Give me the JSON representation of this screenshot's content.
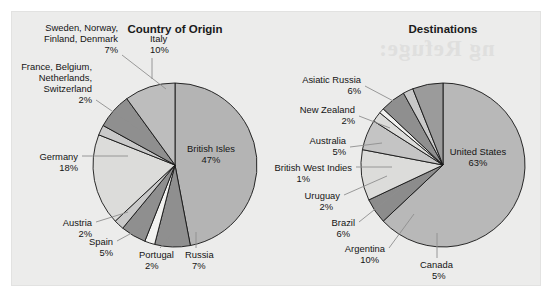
{
  "figure": {
    "background_color": "#ffffff",
    "panel_color": "#ececeb"
  },
  "bleed_text": {
    "line1": "ng Refuge:"
  },
  "charts": [
    {
      "title": "Country of Origin",
      "center": {
        "x": 175,
        "y": 165
      },
      "radius": 82
    },
    {
      "title": "Destinations",
      "center": {
        "x": 443,
        "y": 165
      },
      "radius": 82
    }
  ],
  "chart_data": [
    {
      "type": "pie",
      "title": "Country of Origin",
      "labels": [
        "British Isles",
        "Russia",
        "Portugal",
        "Spain",
        "Austria",
        "Germany",
        "France, Belgium, Netherlands, Switzerland",
        "Sweden, Norway, Finland, Denmark",
        "Italy"
      ],
      "values": [
        47,
        7,
        2,
        5,
        2,
        18,
        2,
        7,
        10
      ],
      "value_labels": [
        "47%",
        "7%",
        "2%",
        "5%",
        "2%",
        "18%",
        "2%",
        "7%",
        "10%"
      ],
      "colors": [
        "#b4b4b4",
        "#8f8f8f",
        "#f2f2f0",
        "#8f8f8f",
        "#c9c9c9",
        "#dcdcda",
        "#c9c9c9",
        "#8f8f8f",
        "#bdbdbd"
      ],
      "start_angle_deg": 0,
      "direction": "clockwise",
      "legend": "none",
      "label_placement": "callout"
    },
    {
      "type": "pie",
      "title": "Destinations",
      "labels": [
        "United States",
        "Canada",
        "Argentina",
        "Brazil",
        "Uruguay",
        "British West Indies",
        "Australia",
        "New Zealand",
        "Asiatic Russia"
      ],
      "values": [
        63,
        5,
        10,
        6,
        2,
        1,
        5,
        2,
        6
      ],
      "value_labels": [
        "63%",
        "5%",
        "10%",
        "6%",
        "2%",
        "1%",
        "5%",
        "2%",
        "6%"
      ],
      "colors": [
        "#b8b8b8",
        "#8c8c8c",
        "#dcdcda",
        "#c4c4c4",
        "#dcdcda",
        "#f2f2f0",
        "#8f8f8f",
        "#c9c9c9",
        "#9b9b9b"
      ],
      "start_angle_deg": 0,
      "direction": "clockwise",
      "legend": "none",
      "label_placement": "callout"
    }
  ],
  "labels_left": [
    {
      "name": "italy",
      "line1": "Italy",
      "line2": "10%",
      "x": 150,
      "y": 48,
      "anchor": "start"
    },
    {
      "name": "sweden-group",
      "line1": "Sweden, Norway,",
      "line2": "Finland, Denmark",
      "line3": "7%",
      "x": 118,
      "y": 48,
      "anchor": "end"
    },
    {
      "name": "france-group",
      "line1": "France, Belgium,",
      "line2": "Netherlands,",
      "line3": "Switzerland",
      "line4": "2%",
      "x": 92,
      "y": 90,
      "anchor": "end"
    },
    {
      "name": "germany",
      "line1": "Germany",
      "line2": "18%",
      "x": 78,
      "y": 160,
      "anchor": "end"
    },
    {
      "name": "austria",
      "line1": "Austria",
      "line2": "2%",
      "x": 92,
      "y": 226,
      "anchor": "end"
    },
    {
      "name": "spain",
      "line1": "Spain",
      "line2": "5%",
      "x": 113,
      "y": 245,
      "anchor": "end"
    },
    {
      "name": "portugal",
      "line1": "Portugal",
      "line2": "2%",
      "x": 139,
      "y": 258,
      "anchor": "start"
    },
    {
      "name": "russia",
      "line1": "Russia",
      "line2": "7%",
      "x": 185,
      "y": 258,
      "anchor": "start"
    },
    {
      "name": "british-isles",
      "line1": "British Isles",
      "line2": "47%",
      "x": 211,
      "y": 152,
      "anchor": "middle"
    }
  ],
  "labels_right": [
    {
      "name": "asiatic-russia",
      "line1": "Asiatic Russia",
      "line2": "6%",
      "x": 361,
      "y": 83,
      "anchor": "end"
    },
    {
      "name": "new-zealand",
      "line1": "New Zealand",
      "line2": "2%",
      "x": 355,
      "y": 113,
      "anchor": "end"
    },
    {
      "name": "australia",
      "line1": "Australia",
      "line2": "5%",
      "x": 346,
      "y": 144,
      "anchor": "end"
    },
    {
      "name": "british-west-indies",
      "line1": "British West Indies",
      "line2": "1%",
      "x": 352,
      "y": 171,
      "anchor": "end"
    },
    {
      "name": "uruguay",
      "line1": "Uruguay",
      "line2": "2%",
      "x": 340,
      "y": 199,
      "anchor": "end"
    },
    {
      "name": "brazil",
      "line1": "Brazil",
      "line2": "6%",
      "x": 355,
      "y": 226,
      "anchor": "end"
    },
    {
      "name": "argentina",
      "line1": "Argentina",
      "line2": "10%",
      "x": 385,
      "y": 252,
      "anchor": "end"
    },
    {
      "name": "canada",
      "line1": "Canada",
      "line2": "5%",
      "x": 420,
      "y": 268,
      "anchor": "start"
    },
    {
      "name": "united-states",
      "line1": "United States",
      "line2": "63%",
      "x": 478,
      "y": 155,
      "anchor": "middle"
    }
  ]
}
